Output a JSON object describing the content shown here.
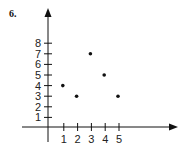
{
  "problem_number": "6.",
  "chart_data": {
    "type": "scatter",
    "title": "",
    "xlabel": "",
    "ylabel": "",
    "x_ticks": [
      1,
      2,
      3,
      4,
      5
    ],
    "y_ticks": [
      1,
      2,
      3,
      4,
      5,
      6,
      7,
      8
    ],
    "points": [
      {
        "x": 1,
        "y": 4
      },
      {
        "x": 2,
        "y": 3
      },
      {
        "x": 3,
        "y": 7
      },
      {
        "x": 4,
        "y": 5
      },
      {
        "x": 5,
        "y": 3
      }
    ],
    "grid": false,
    "legend": null,
    "axes_arrows": true
  },
  "layout": {
    "origin_x": 48,
    "origin_y": 127,
    "x_unit_px": 13.8,
    "y_unit_px": 10.6,
    "x_axis_end": 178,
    "x_axis_start": 22,
    "y_axis_top": 8,
    "y_axis_bottom": 142,
    "color": "#111111"
  }
}
